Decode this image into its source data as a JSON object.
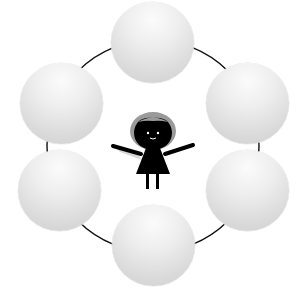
{
  "diagram": {
    "type": "cycle",
    "ring": {
      "cx": 153,
      "cy": 146,
      "r": 106,
      "color": "#111111"
    },
    "nodes": [
      {
        "id": "top",
        "label": "",
        "x": 111,
        "y": 2
      },
      {
        "id": "top-right",
        "label": "",
        "x": 206,
        "y": 63
      },
      {
        "id": "bottom-right",
        "label": "",
        "x": 206,
        "y": 150
      },
      {
        "id": "bottom",
        "label": "",
        "x": 112,
        "y": 205
      },
      {
        "id": "bottom-left",
        "label": "",
        "x": 18,
        "y": 150
      },
      {
        "id": "top-left",
        "label": "",
        "x": 20,
        "y": 63
      }
    ],
    "center": {
      "icon": "girl-character-icon",
      "body_color": "#000000",
      "hair_color": "#999999"
    }
  }
}
